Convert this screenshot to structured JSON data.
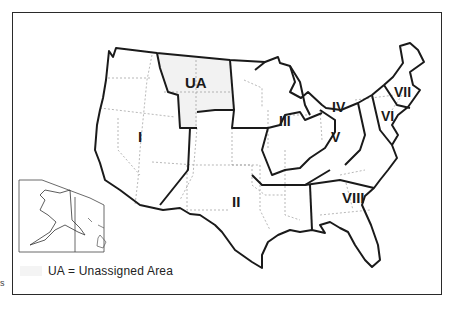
{
  "map": {
    "type": "US administrative regions map",
    "colors": {
      "border": "#1a1a1a",
      "state_line": "#9a9a9a",
      "unassigned_fill": "#f2f2f2",
      "background": "#ffffff"
    },
    "regions": [
      {
        "id": "I",
        "label": "I"
      },
      {
        "id": "II",
        "label": "II"
      },
      {
        "id": "III",
        "label": "III"
      },
      {
        "id": "IV",
        "label": "IV"
      },
      {
        "id": "V",
        "label": "V"
      },
      {
        "id": "VI",
        "label": "VI"
      },
      {
        "id": "VII",
        "label": "VII"
      },
      {
        "id": "VIII",
        "label": "VIII"
      },
      {
        "id": "UA",
        "label": "UA"
      }
    ],
    "insets": [
      "Alaska",
      "Hawaii"
    ]
  },
  "legend": {
    "text": "UA = Unassigned Area",
    "swatch_color": "#f4f4f4"
  },
  "margin_text": "s"
}
